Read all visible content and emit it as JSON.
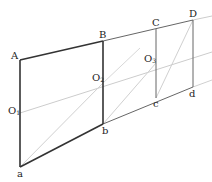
{
  "diagram": {
    "colors": {
      "dark": "#333333",
      "medium": "#666666",
      "light": "#c8c8c8"
    },
    "points": {
      "A": {
        "label": "A",
        "x": 20,
        "y": 60
      },
      "B": {
        "label": "B",
        "x": 103,
        "y": 41
      },
      "C": {
        "label": "C",
        "x": 156,
        "y": 29
      },
      "D": {
        "label": "D",
        "x": 193,
        "y": 20
      },
      "a": {
        "label": "a",
        "x": 20,
        "y": 167
      },
      "b": {
        "label": "b",
        "x": 103,
        "y": 124
      },
      "c": {
        "label": "c",
        "x": 156,
        "y": 98
      },
      "d": {
        "label": "d",
        "x": 193,
        "y": 87
      },
      "O1": {
        "label": "O",
        "sub": "1",
        "x": 20,
        "y": 113
      },
      "O2": {
        "label": "O",
        "sub": "2",
        "x": 103,
        "y": 83
      },
      "O3": {
        "label": "O",
        "sub": "3",
        "x": 156,
        "y": 63
      }
    },
    "labels": {
      "A": "A",
      "B": "B",
      "C": "C",
      "D": "D",
      "a": "a",
      "b": "b",
      "c": "c",
      "d": "d",
      "O": "O",
      "sub1": "1",
      "sub2": "2",
      "sub3": "3"
    }
  }
}
